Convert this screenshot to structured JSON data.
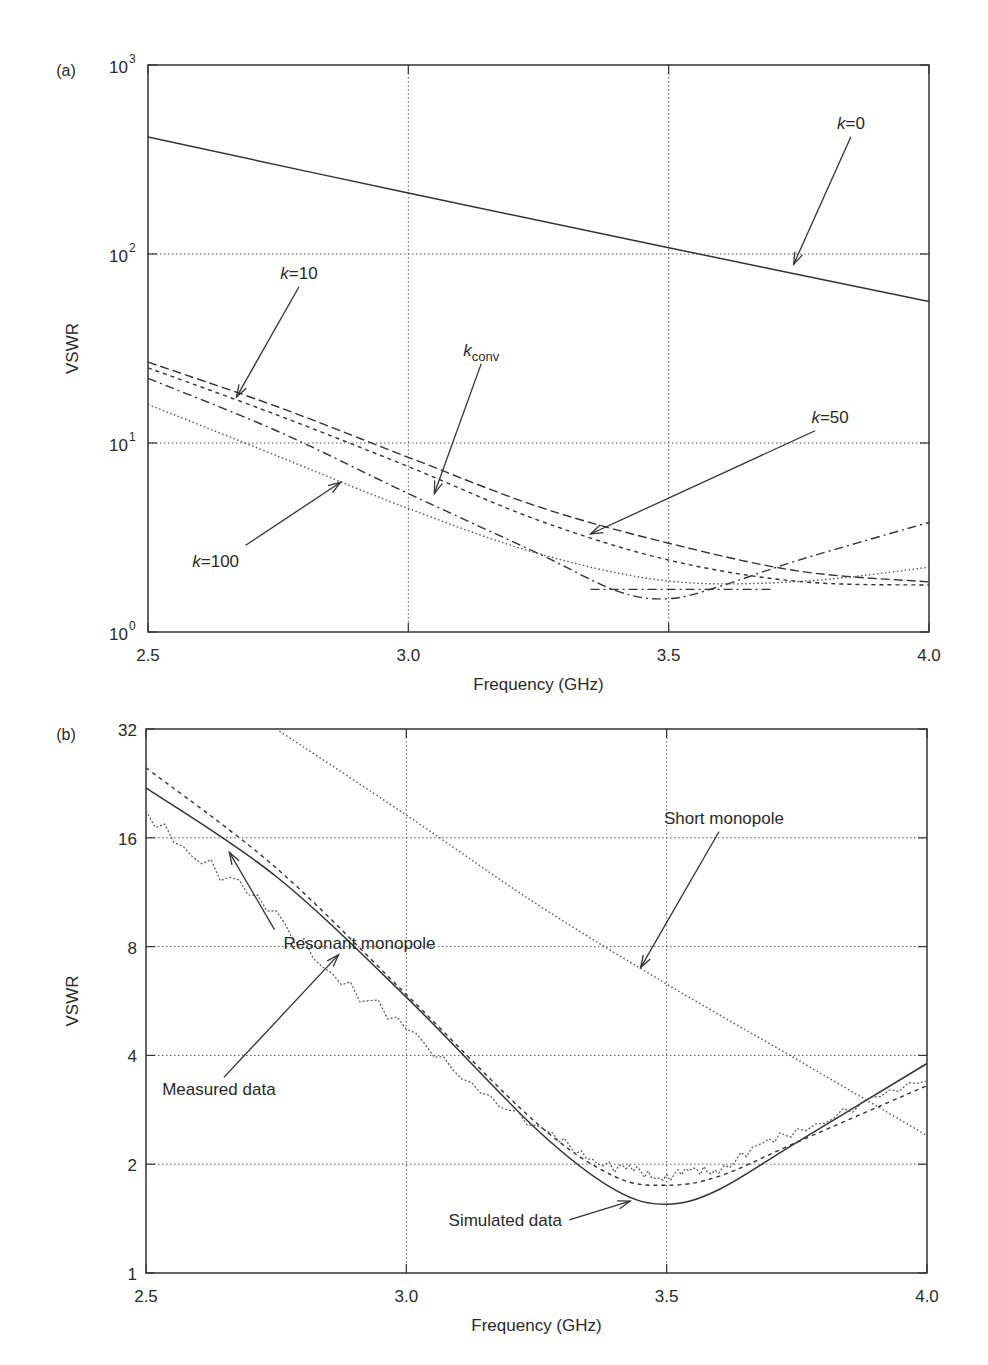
{
  "chart_data": [
    {
      "panel": "(a)",
      "type": "line",
      "xlabel": "Frequency (GHz)",
      "ylabel": "VSWR",
      "yscale": "log10",
      "xlim": [
        2.5,
        4.0
      ],
      "ylim": [
        1,
        1000
      ],
      "xticks": [
        "2.5",
        "3.0",
        "3.5",
        "4.0"
      ],
      "yticks": [
        {
          "base": "10",
          "exp": "0"
        },
        {
          "base": "10",
          "exp": "1"
        },
        {
          "base": "10",
          "exp": "2"
        },
        {
          "base": "10",
          "exp": "3"
        }
      ],
      "grid": true,
      "series": [
        {
          "name": "k=0",
          "style": "solid",
          "x": [
            2.5,
            3.0,
            3.5,
            4.0
          ],
          "values": [
            416,
            210,
            108,
            56
          ]
        },
        {
          "name": "k=10",
          "style": "dashed",
          "x": [
            2.5,
            2.75,
            3.0,
            3.25,
            3.5,
            3.75,
            4.0
          ],
          "values": [
            26.8,
            15.5,
            8.4,
            4.6,
            2.95,
            2.1,
            1.84
          ]
        },
        {
          "name": "k_conv",
          "style": "short-dash",
          "x": [
            2.5,
            2.75,
            3.0,
            3.25,
            3.5,
            3.75,
            4.0
          ],
          "values": [
            25,
            14,
            7.5,
            3.9,
            2.4,
            1.85,
            1.77
          ]
        },
        {
          "name": "k=50",
          "style": "dash-dot",
          "x": [
            2.5,
            2.75,
            3.0,
            3.25,
            3.4,
            3.5,
            3.6,
            3.75,
            4.0
          ],
          "values": [
            22,
            11.5,
            5.4,
            2.6,
            1.65,
            1.5,
            1.75,
            2.4,
            3.8
          ]
        },
        {
          "name": "k=100",
          "style": "dotted",
          "x": [
            2.5,
            2.75,
            3.0,
            3.25,
            3.5,
            3.75,
            4.0
          ],
          "values": [
            16,
            8.5,
            4.5,
            2.6,
            1.86,
            1.85,
            2.2
          ]
        }
      ],
      "annotations": [
        {
          "text_k": "k",
          "text_rest": "=0",
          "label_x": 3.85,
          "label_y": 460,
          "arrow_to_x": 3.74,
          "arrow_to_y": 88
        },
        {
          "text_k": "k",
          "text_rest": "=10",
          "label_x": 2.79,
          "label_y": 74,
          "arrow_to_x": 2.67,
          "arrow_to_y": 17.5
        },
        {
          "text_k": "k",
          "text_sub": "conv",
          "label_x": 3.14,
          "label_y": 29,
          "arrow_to_x": 3.05,
          "arrow_to_y": 5.4
        },
        {
          "text_k": "k",
          "text_rest": "=50",
          "label_x": 3.81,
          "label_y": 12.8,
          "arrow_to_x": 3.35,
          "arrow_to_y": 3.3
        },
        {
          "text_k": "k",
          "text_rest": "=100",
          "label_x": 2.63,
          "label_y": 2.2,
          "arrow_to_x": 2.87,
          "arrow_to_y": 6.2
        }
      ]
    },
    {
      "panel": "(b)",
      "type": "line",
      "xlabel": "Frequency (GHz)",
      "ylabel": "VSWR",
      "yscale": "log2",
      "xlim": [
        2.5,
        4.0
      ],
      "ylim": [
        1,
        32
      ],
      "xticks": [
        "2.5",
        "3.0",
        "3.5",
        "4.0"
      ],
      "yticks": [
        "1",
        "2",
        "4",
        "8",
        "16",
        "32"
      ],
      "grid": true,
      "series": [
        {
          "name": "Simulated data (resonant monopole)",
          "style": "solid",
          "x": [
            2.5,
            2.75,
            3.0,
            3.25,
            3.4,
            3.5,
            3.6,
            3.75,
            4.0
          ],
          "values": [
            22,
            12.5,
            5.8,
            2.5,
            1.7,
            1.55,
            1.7,
            2.3,
            3.8
          ]
        },
        {
          "name": "Resonant monopole (model)",
          "style": "short-dash",
          "x": [
            2.5,
            2.75,
            3.0,
            3.25,
            3.4,
            3.5,
            3.6,
            3.75,
            4.0
          ],
          "values": [
            25,
            13.2,
            5.9,
            2.6,
            1.85,
            1.75,
            1.85,
            2.3,
            3.3
          ]
        },
        {
          "name": "Measured data",
          "style": "dotted-noisy",
          "x": [
            2.5,
            2.75,
            3.0,
            3.25,
            3.4,
            3.5,
            3.6,
            3.75,
            4.0
          ],
          "values": [
            19,
            9.5,
            4.6,
            2.5,
            1.95,
            1.85,
            1.95,
            2.5,
            3.4
          ]
        },
        {
          "name": "Short monopole",
          "style": "dotted",
          "x": [
            2.75,
            3.0,
            3.25,
            3.5,
            3.75,
            4.0
          ],
          "values": [
            32,
            18.5,
            10.5,
            6.3,
            3.9,
            2.4
          ]
        }
      ],
      "annotations": [
        {
          "text": "Short monopole",
          "label_x": 3.61,
          "label_y": 17.5,
          "arrow_to_x": 3.45,
          "arrow_to_y": 7.0
        },
        {
          "text": "Resonant monopole",
          "label_x": 2.91,
          "label_y": 7.9,
          "arrow_to_x": 2.66,
          "arrow_to_y": 14.6
        },
        {
          "text": "Measured data",
          "label_x": 2.64,
          "label_y": 3.1,
          "arrow_to_x": 2.87,
          "arrow_to_y": 7.6
        },
        {
          "text": "Simulated data",
          "label_x": 3.19,
          "label_y": 1.35,
          "arrow_to_x": 3.43,
          "arrow_to_y": 1.58
        }
      ]
    }
  ],
  "panels": {
    "a": {
      "label": "(a)",
      "ylabel": "VSWR",
      "xlabel": "Frequency (GHz)"
    },
    "b": {
      "label": "(b)",
      "ylabel": "VSWR",
      "xlabel": "Frequency (GHz)"
    }
  }
}
